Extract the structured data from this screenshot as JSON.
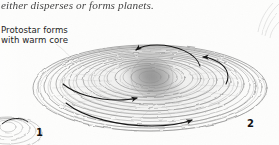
{
  "figure": {
    "type": "scientific-illustration",
    "medium": "grayscale pen-and-ink / pencil scan",
    "caption_fragment": "either disperses or forms planets.",
    "annotation": {
      "line1": "Protostar forms",
      "line2": "with warm core"
    },
    "figure_numbers": {
      "left": "1",
      "right": "2"
    },
    "colors": {
      "background": "#fdfdfc",
      "ink": "#2b2b2b",
      "line": "#6f6f6f",
      "core_shadow": "#8d8d8d",
      "arrow": "#151515"
    },
    "elements": {
      "disk_rings": 16,
      "rotation_arrows": 4,
      "arrow_directions": [
        "counterclockwise-top-left",
        "up-left-right-edge",
        "right-mid",
        "right-bottom"
      ]
    }
  }
}
